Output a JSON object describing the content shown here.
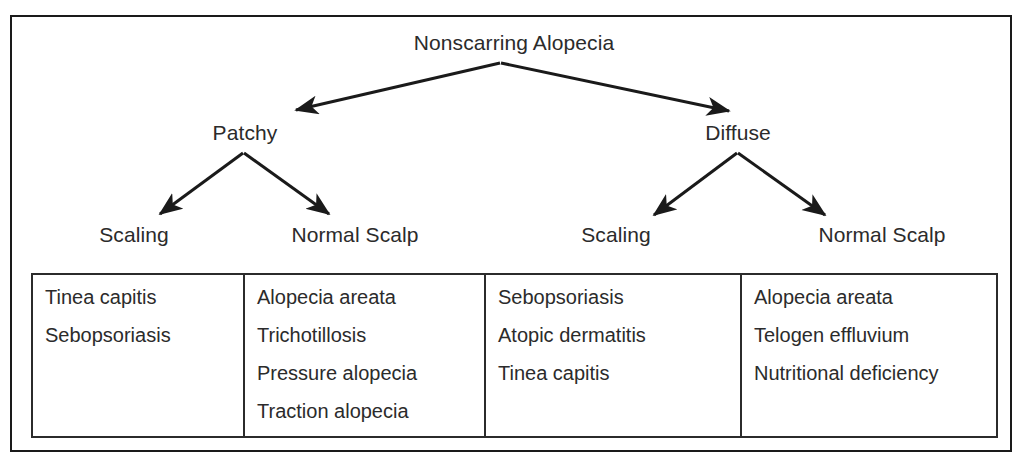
{
  "diagram": {
    "title": "Nonscarring Alopecia",
    "nodes": {
      "root": "Nonscarring Alopecia",
      "patchy": "Patchy",
      "diffuse": "Diffuse",
      "patchy_scaling": "Scaling",
      "patchy_normal_scalp": "Normal Scalp",
      "diffuse_scaling": "Scaling",
      "diffuse_normal_scalp": "Normal Scalp"
    },
    "table": {
      "columns": [
        {
          "parent": "Patchy",
          "header": "Scaling",
          "items": [
            "Tinea capitis",
            "Sebopsoriasis"
          ]
        },
        {
          "parent": "Patchy",
          "header": "Normal Scalp",
          "items": [
            "Alopecia areata",
            "Trichotillosis",
            "Pressure alopecia",
            "Traction alopecia"
          ]
        },
        {
          "parent": "Diffuse",
          "header": "Scaling",
          "items": [
            "Sebopsoriasis",
            "Atopic dermatitis",
            "Tinea capitis"
          ]
        },
        {
          "parent": "Diffuse",
          "header": "Normal Scalp",
          "items": [
            "Alopecia areata",
            "Telogen effluvium",
            "Nutritional deficiency"
          ]
        }
      ]
    },
    "colors": {
      "line": "#1a1a1a",
      "text": "#2b2b2b",
      "background": "#ffffff"
    }
  }
}
